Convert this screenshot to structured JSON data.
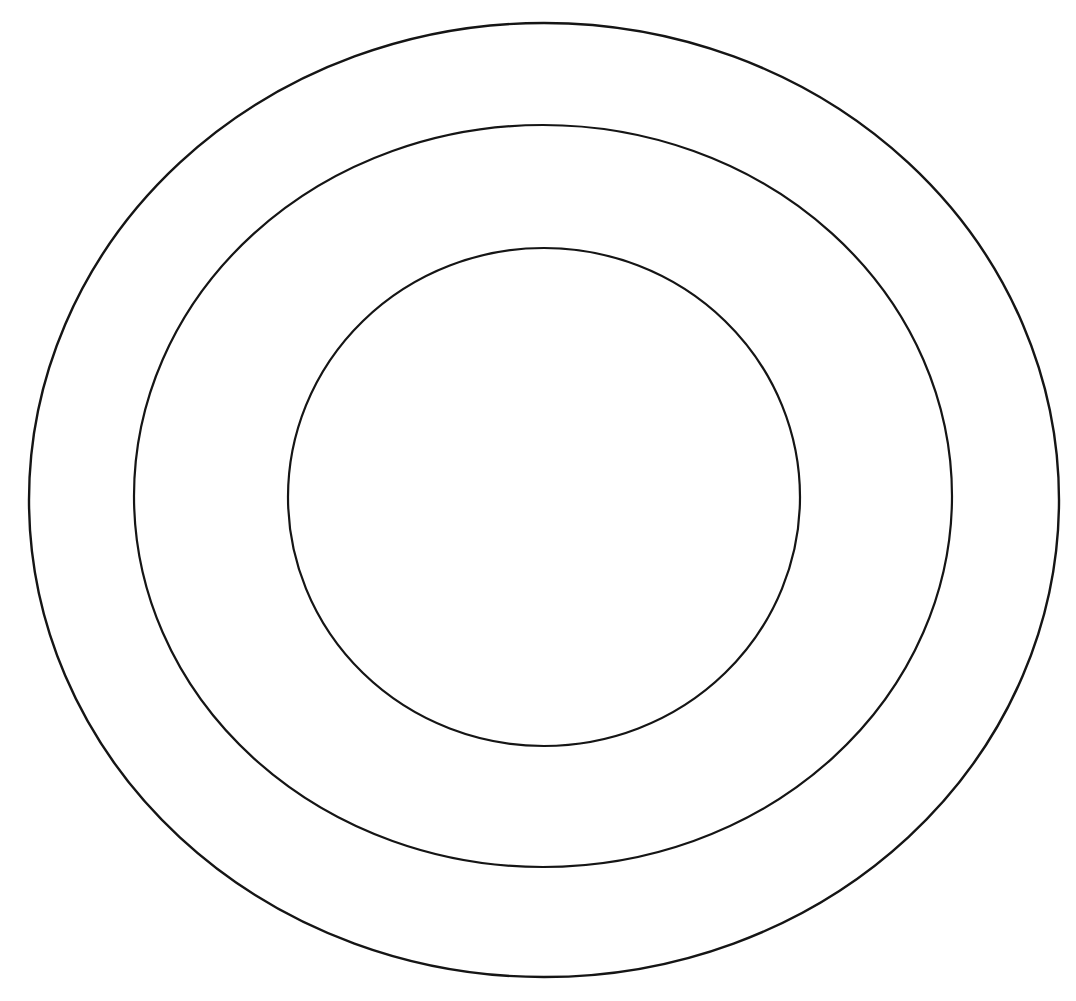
{
  "figure": {
    "background_color": "#ffffff",
    "stroke_color": "#151515",
    "width": 1076,
    "height": 1001,
    "shape_count": 3
  },
  "chart_data": {
    "type": "scatter",
    "xlabel": "",
    "ylabel": "",
    "xlim": [
      0,
      1076
    ],
    "ylim": [
      0,
      1001
    ],
    "grid": false,
    "legend_position": "none",
    "shapes": [
      {
        "name": "outer-circle",
        "shape": "ellipse",
        "cx": 544,
        "cy": 500,
        "rx": 515,
        "ry": 477,
        "left": 29,
        "right": 1059,
        "top": 23,
        "bottom": 977,
        "stroke": "#151515",
        "stroke_width": 2.4,
        "fill": "none"
      },
      {
        "name": "middle-circle",
        "shape": "ellipse",
        "cx": 543,
        "cy": 496,
        "rx": 409,
        "ry": 371,
        "left": 134,
        "right": 952,
        "top": 125,
        "bottom": 867,
        "stroke": "#151515",
        "stroke_width": 2.2,
        "fill": "none"
      },
      {
        "name": "inner-circle",
        "shape": "ellipse",
        "cx": 544,
        "cy": 497,
        "rx": 256,
        "ry": 249,
        "left": 288,
        "right": 800,
        "top": 248,
        "bottom": 746,
        "stroke": "#151515",
        "stroke_width": 2.2,
        "fill": "none"
      }
    ]
  }
}
